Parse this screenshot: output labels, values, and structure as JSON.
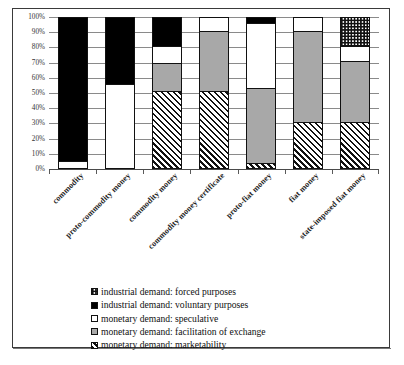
{
  "chart_data": {
    "type": "bar",
    "subtype": "stacked-percent",
    "title": "",
    "xlabel": "",
    "ylabel": "",
    "ylim": [
      0,
      100
    ],
    "yticks": [
      "0%",
      "10%",
      "20%",
      "30%",
      "40%",
      "50%",
      "60%",
      "70%",
      "80%",
      "90%",
      "100%"
    ],
    "ytick_values": [
      0,
      10,
      20,
      30,
      40,
      50,
      60,
      70,
      80,
      90,
      100
    ],
    "grid": true,
    "legend_position": "bottom",
    "categories": [
      "commodity",
      "proto-commodity money",
      "commodity money",
      "commodity money certificate",
      "proto-fiat money",
      "fiat money",
      "state-imposed fiat money"
    ],
    "series": [
      {
        "name": "monetary demand: marketability",
        "pattern": "diagonal-hatch",
        "color": "#ffffff",
        "values": [
          0,
          0,
          51,
          51,
          4,
          31,
          31
        ]
      },
      {
        "name": "monetary demand: facilitation of exchange",
        "pattern": "solid-gray",
        "color": "#a8a8a8",
        "values": [
          0,
          0,
          19,
          40,
          49,
          60,
          40
        ]
      },
      {
        "name": "monetary demand: speculative",
        "pattern": "solid-white",
        "color": "#ffffff",
        "values": [
          5,
          56,
          11,
          9,
          43,
          9,
          10
        ]
      },
      {
        "name": "industrial demand: voluntary purposes",
        "pattern": "solid-black",
        "color": "#000000",
        "values": [
          95,
          44,
          19,
          0,
          4,
          0,
          0
        ]
      },
      {
        "name": "industrial demand: forced purposes",
        "pattern": "dotted",
        "color": "#ffffff",
        "values": [
          0,
          0,
          0,
          0,
          0,
          0,
          19
        ]
      }
    ],
    "legend": [
      {
        "label": "industrial demand: forced purposes",
        "swatch": "dotted"
      },
      {
        "label": "industrial demand: voluntary purposes",
        "swatch": "solid-black"
      },
      {
        "label": "monetary demand: speculative",
        "swatch": "solid-white"
      },
      {
        "label": "monetary demand: facilitation of exchange",
        "swatch": "solid-gray"
      },
      {
        "label": "monetary demand: marketability",
        "swatch": "diagonal-hatch"
      }
    ]
  }
}
